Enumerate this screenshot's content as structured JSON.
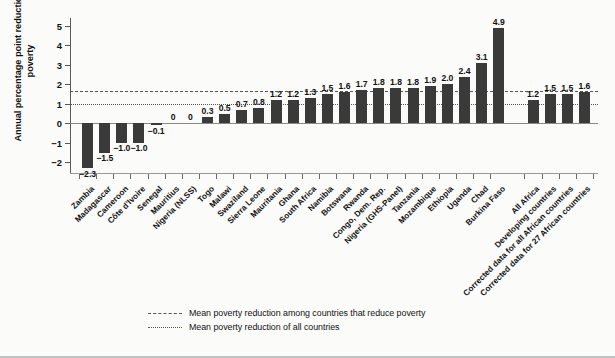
{
  "chart_data": {
    "type": "bar",
    "title": "",
    "xlabel": "",
    "ylabel": "Annual percentage point reduction in poverty",
    "ylim": [
      -2.6,
      5.4
    ],
    "yticks": [
      -2,
      -1,
      0,
      1,
      2,
      3,
      4,
      5
    ],
    "ytick_labels": [
      "−2",
      "−1",
      "0",
      "1",
      "2",
      "3",
      "4",
      "5"
    ],
    "grid": false,
    "legend_position": "bottom-center",
    "bar_color": "#3a3a3a",
    "categories": [
      "Zambia",
      "Madagascar",
      "Cameroon",
      "Côte d'Ivoire",
      "Senegal",
      "Mauritius",
      "Nigeria (NLSS)",
      "Togo",
      "Malawi",
      "Swaziland",
      "Sierra Leone",
      "Mauritania",
      "Ghana",
      "South Africa",
      "Namibia",
      "Botswana",
      "Rwanda",
      "Congo, Dem. Rep.",
      "Nigeria (GHS-Panel)",
      "Tanzania",
      "Mozambique",
      "Ethiopia",
      "Uganda",
      "Chad",
      "Burkina Faso",
      "All Africa",
      "Developing countries",
      "Corrected data for all African countries",
      "Corrected data for 27 African countries"
    ],
    "values": [
      -2.3,
      -1.5,
      -1.0,
      -1.0,
      -0.1,
      0,
      0,
      0.3,
      0.5,
      0.7,
      0.8,
      1.2,
      1.2,
      1.3,
      1.5,
      1.6,
      1.7,
      1.8,
      1.8,
      1.8,
      1.9,
      2.0,
      2.4,
      3.1,
      4.9,
      1.2,
      1.5,
      1.5,
      1.6
    ],
    "data_labels": [
      "−2.3",
      "−1.5",
      "−1.0",
      "−1.0",
      "−0.1",
      "0",
      "0",
      "0.3",
      "0.5",
      "0.7",
      "0.8",
      "1.2",
      "1.2",
      "1.3",
      "1.5",
      "1.6",
      "1.7",
      "1.8",
      "1.8",
      "1.8",
      "1.9",
      "2.0",
      "2.4",
      "3.1",
      "4.9",
      "1.2",
      "1.5",
      "1.5",
      "1.6"
    ],
    "group_break_after_index": 24,
    "reference_lines": [
      {
        "label": "Mean poverty reduction among countries that reduce poverty",
        "value": 1.65,
        "style": "dashed"
      },
      {
        "label": "Mean poverty reduction of all countries",
        "value": 0.97,
        "style": "dotted"
      }
    ],
    "legend": [
      "Mean poverty reduction among countries that reduce poverty",
      "Mean poverty reduction of all countries"
    ]
  }
}
